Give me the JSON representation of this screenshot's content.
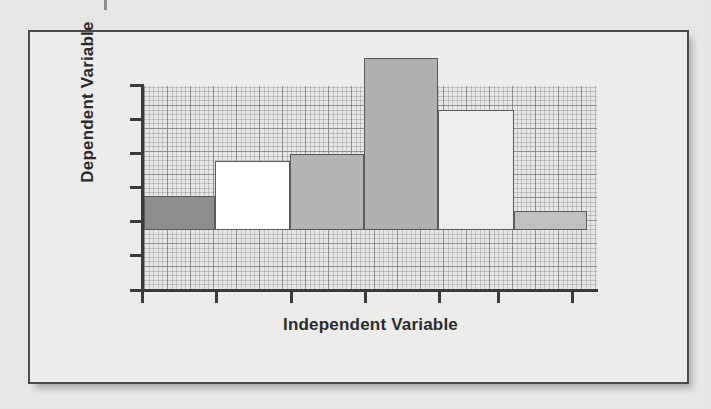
{
  "figure": {
    "background_color": "#e9e9e7",
    "frame_color": "#4a4a4a",
    "plot_background_color": "#e6e6e4",
    "axis_color": "#3a3a3a"
  },
  "chart_data": {
    "type": "bar",
    "title": "",
    "subtitle": "",
    "xlabel": "Independent Variable",
    "ylabel": "Dependent Variable",
    "categories": [
      "1",
      "2",
      "3",
      "4",
      "5",
      "6"
    ],
    "values": [
      1.0,
      2.0,
      2.2,
      5.0,
      3.5,
      0.55
    ],
    "ylim": [
      0,
      6
    ],
    "xlim": [
      0,
      7
    ],
    "y_tick_values": [
      0,
      1,
      2,
      3,
      4,
      5,
      6
    ],
    "y_tick_labels": [
      "",
      "",
      "",
      "",
      "",
      "",
      ""
    ],
    "x_tick_labels": [
      "",
      "",
      "",
      "",
      "",
      "",
      ""
    ],
    "grid": true,
    "grid_style": "graph-paper",
    "legend": false,
    "legend_position": "none",
    "bar_colors": [
      "#8d8d8d",
      "#ffffff",
      "#b4b4b4",
      "#b0b0b0",
      "#ededeb",
      "#c0c0c0"
    ],
    "bar_edge_color": "#5b5b5b",
    "annotations": []
  },
  "axes": {
    "y_ticks": [
      {
        "index": 0,
        "top_px": 52
      },
      {
        "index": 1,
        "top_px": 86
      },
      {
        "index": 2,
        "top_px": 120
      },
      {
        "index": 3,
        "top_px": 154
      },
      {
        "index": 4,
        "top_px": 188
      },
      {
        "index": 5,
        "top_px": 222
      },
      {
        "index": 6,
        "top_px": 257
      }
    ],
    "x_ticks": [
      {
        "index": 0,
        "left_px": 111
      },
      {
        "index": 1,
        "left_px": 185
      },
      {
        "index": 2,
        "left_px": 260
      },
      {
        "index": 3,
        "left_px": 334
      },
      {
        "index": 4,
        "left_px": 408
      },
      {
        "index": 5,
        "left_px": 467
      },
      {
        "index": 6,
        "left_px": 541
      }
    ]
  },
  "bars": [
    {
      "name": "bar-1",
      "left_px": 114,
      "width_px": 71,
      "height_px": 34,
      "color": "#8d8d8d"
    },
    {
      "name": "bar-2",
      "left_px": 185,
      "width_px": 75,
      "height_px": 69,
      "color": "#ffffff"
    },
    {
      "name": "bar-3",
      "left_px": 260,
      "width_px": 74,
      "height_px": 76,
      "color": "#b4b4b4"
    },
    {
      "name": "bar-4",
      "left_px": 334,
      "width_px": 74,
      "height_px": 172,
      "color": "#b0b0b0"
    },
    {
      "name": "bar-5",
      "left_px": 408,
      "width_px": 76,
      "height_px": 120,
      "color": "#ededeb"
    },
    {
      "name": "bar-6",
      "left_px": 484,
      "width_px": 73,
      "height_px": 19,
      "color": "#c0c0c0"
    }
  ]
}
